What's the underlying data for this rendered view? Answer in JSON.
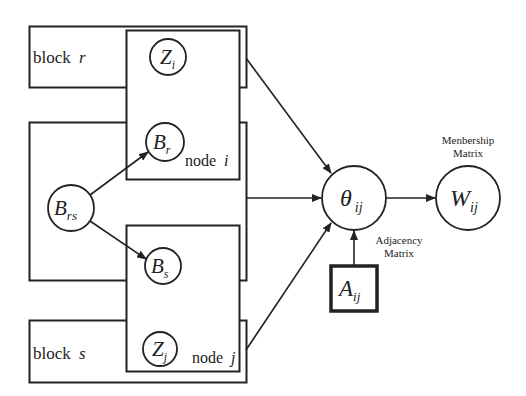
{
  "diagram": {
    "colors": {
      "stroke": "#222222",
      "background": "#ffffff"
    },
    "blocks": {
      "block_r": {
        "label": "block",
        "var": "r"
      },
      "block_s": {
        "label": "block",
        "var": "s"
      }
    },
    "plates": {
      "node_i": {
        "label": "node",
        "var": "i"
      },
      "node_j": {
        "label": "node",
        "var": "j"
      }
    },
    "nodes": {
      "z_i": {
        "sym": "Z",
        "sub": "i"
      },
      "b_r": {
        "sym": "B",
        "sub": "r"
      },
      "b_rs": {
        "sym": "B",
        "sub": "rs"
      },
      "b_s": {
        "sym": "B",
        "sub": "s"
      },
      "z_j": {
        "sym": "Z",
        "sub": "j"
      },
      "theta": {
        "sym": "θ",
        "sub": "ij"
      },
      "w": {
        "sym": "W",
        "sub": "ij"
      },
      "a": {
        "sym": "A",
        "sub": "ij"
      }
    },
    "annotations": {
      "membership_line1": "Menbership",
      "membership_line2": "Matrix",
      "adjacency_line1": "Adjacency",
      "adjacency_line2": "Matrix"
    },
    "edges": [
      {
        "from": "B_rs",
        "to": "B_r"
      },
      {
        "from": "B_rs",
        "to": "B_s"
      },
      {
        "from": "node i plate",
        "to": "θ_ij"
      },
      {
        "from": "middle block",
        "to": "θ_ij"
      },
      {
        "from": "node j plate",
        "to": "θ_ij"
      },
      {
        "from": "A_ij",
        "to": "θ_ij"
      },
      {
        "from": "θ_ij",
        "to": "W_ij"
      }
    ]
  }
}
